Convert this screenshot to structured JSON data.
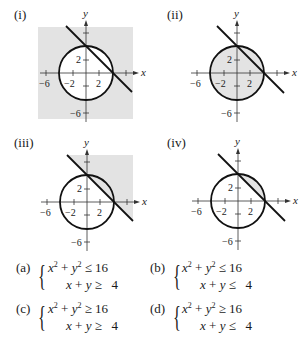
{
  "panels": [
    {
      "label": "(i)",
      "shade": "outside-circle-and-above-line-box",
      "origin": [
        86,
        73
      ]
    },
    {
      "label": "(ii)",
      "shade": "inside-circle",
      "origin": [
        237,
        73
      ]
    },
    {
      "label": "(iii)",
      "shade": "above-line-box",
      "origin": [
        87,
        202
      ]
    },
    {
      "label": "(iv)",
      "shade": "circle-segment-above-line",
      "origin": [
        238,
        201
      ]
    }
  ],
  "axes": {
    "x_name": "x",
    "y_name": "y",
    "x_ticks": [
      "−6",
      "−2",
      "2"
    ],
    "y_ticks": [
      "2",
      "−6"
    ]
  },
  "curves": {
    "circle": "x² + y² = 16",
    "line": "x + y = 4"
  },
  "choices": [
    {
      "label": "(a)",
      "line1": {
        "lhs": "x",
        "mid": " + ",
        "lhs2": "y",
        "rel": " ≤ ",
        "rhs": "16"
      },
      "line2": {
        "lhs": "x",
        "mid": " + ",
        "lhs2": "y",
        "rel": " ≥ ",
        "rhs": "4"
      }
    },
    {
      "label": "(b)",
      "line1": {
        "lhs": "x",
        "mid": " + ",
        "lhs2": "y",
        "rel": " ≤ ",
        "rhs": "16"
      },
      "line2": {
        "lhs": "x",
        "mid": " + ",
        "lhs2": "y",
        "rel": " ≤ ",
        "rhs": "4"
      }
    },
    {
      "label": "(c)",
      "line1": {
        "lhs": "x",
        "mid": " + ",
        "lhs2": "y",
        "rel": " ≥ ",
        "rhs": "16"
      },
      "line2": {
        "lhs": "x",
        "mid": " + ",
        "lhs2": "y",
        "rel": " ≥ ",
        "rhs": "4"
      }
    },
    {
      "label": "(d)",
      "line1": {
        "lhs": "x",
        "mid": " + ",
        "lhs2": "y",
        "rel": " ≥ ",
        "rhs": "16"
      },
      "line2": {
        "lhs": "x",
        "mid": " + ",
        "lhs2": "y",
        "rel": " ≤ ",
        "rhs": "4"
      }
    }
  ],
  "colors": {
    "shade": "#e3e3e3",
    "stroke": "#111111"
  }
}
